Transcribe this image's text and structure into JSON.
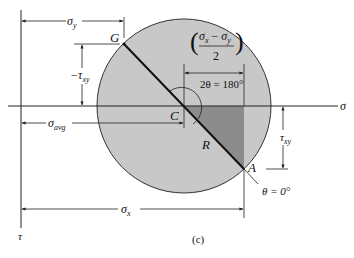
{
  "figure": {
    "caption": "(c)",
    "colors": {
      "circle_fill": "#c8c8c8",
      "triangle_fill": "#8c8c8c",
      "line": "#222222",
      "background": "#ffffff"
    }
  },
  "axes": {
    "horizontal_label": "σ",
    "vertical_label": "τ"
  },
  "points": {
    "center": "C",
    "A": "A",
    "G": "G"
  },
  "labels": {
    "radius": "R",
    "sigma_y": "σ",
    "sigma_y_sub": "y",
    "neg_tau_xy": "−τ",
    "neg_tau_xy_sub": "xy",
    "sigma_avg": "σ",
    "sigma_avg_sub": "avg",
    "sigma_x": "σ",
    "sigma_x_sub": "x",
    "tau_xy": "τ",
    "tau_xy_sub": "xy",
    "half_diff_num_a": "σ",
    "half_diff_num_a_sub": "x",
    "half_diff_minus": " − ",
    "half_diff_num_b": "σ",
    "half_diff_num_b_sub": "y",
    "half_diff_den": "2",
    "angle_2theta": "2θ = 180°",
    "theta_zero": "θ = 0°"
  }
}
